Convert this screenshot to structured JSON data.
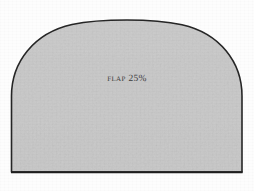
{
  "figure": {
    "kind": "technical-illustration",
    "caption_label": "Flap 25%",
    "shape_name": "rounded-dome-polygon",
    "colors": {
      "background": "#fdfdfd",
      "fill": "#c8c8c8",
      "fill_highlight": "#d2d2d2",
      "fill_shadow": "#bcbcbc",
      "outline": "#262626",
      "label_text": "#3b3b3b"
    },
    "geometry": {
      "left_edge_x": 11,
      "right_edge_x": 242,
      "bottom_edge_y": 172,
      "top_apex_y": 21,
      "shoulder_y": 96,
      "outline_width": 1.6
    },
    "label_position": {
      "center_x": 126,
      "center_y": 80
    }
  }
}
